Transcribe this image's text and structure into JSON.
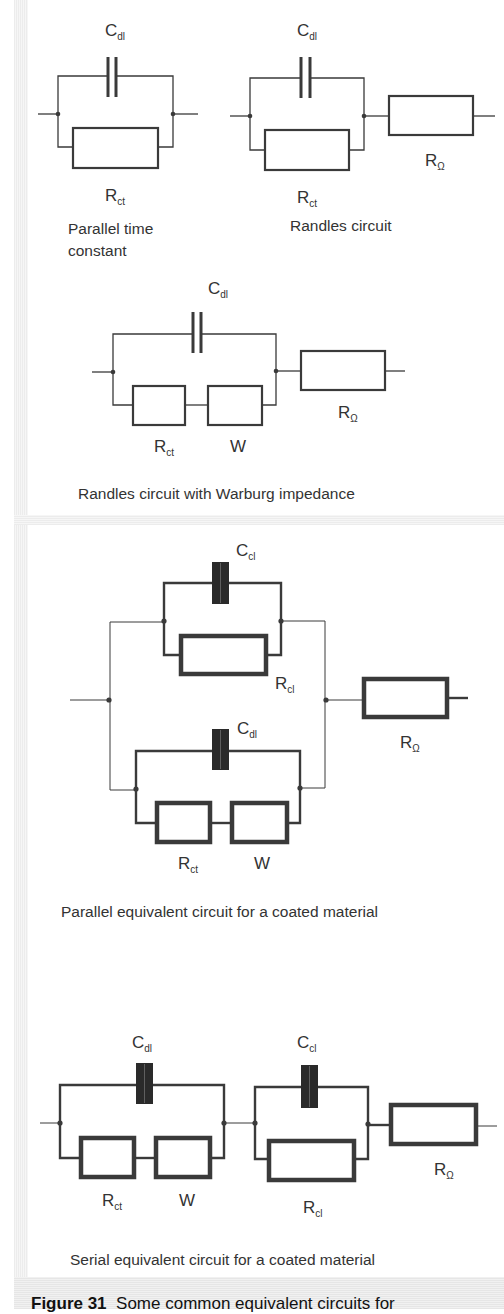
{
  "figure": {
    "number_label": "Figure 31",
    "caption_visible": "Some common equivalent circuits for"
  },
  "circuits": [
    {
      "id": "parallel-time-constant",
      "caption_line1": "Parallel time",
      "caption_line2": "constant",
      "components": [
        {
          "type": "capacitor",
          "label": "C",
          "sub": "dl"
        },
        {
          "type": "resistor",
          "label": "R",
          "sub": "ct"
        }
      ]
    },
    {
      "id": "randles",
      "caption": "Randles circuit",
      "components": [
        {
          "type": "capacitor",
          "label": "C",
          "sub": "dl"
        },
        {
          "type": "resistor",
          "label": "R",
          "sub": "ct"
        },
        {
          "type": "resistor",
          "label": "R",
          "sub": "Ω"
        }
      ]
    },
    {
      "id": "randles-warburg",
      "caption": "Randles circuit with Warburg impedance",
      "components": [
        {
          "type": "capacitor",
          "label": "C",
          "sub": "dl"
        },
        {
          "type": "resistor",
          "label": "R",
          "sub": "ct"
        },
        {
          "type": "warburg",
          "label": "W",
          "sub": ""
        },
        {
          "type": "resistor",
          "label": "R",
          "sub": "Ω"
        }
      ]
    },
    {
      "id": "parallel-coated",
      "caption": "Parallel equivalent circuit for a coated material",
      "components": [
        {
          "type": "capacitor",
          "label": "C",
          "sub": "cl"
        },
        {
          "type": "resistor",
          "label": "R",
          "sub": "cl"
        },
        {
          "type": "capacitor",
          "label": "C",
          "sub": "dl"
        },
        {
          "type": "resistor",
          "label": "R",
          "sub": "ct"
        },
        {
          "type": "warburg",
          "label": "W",
          "sub": ""
        },
        {
          "type": "resistor",
          "label": "R",
          "sub": "Ω"
        }
      ]
    },
    {
      "id": "serial-coated",
      "caption": "Serial equivalent circuit for a coated material",
      "components": [
        {
          "type": "capacitor",
          "label": "C",
          "sub": "dl"
        },
        {
          "type": "resistor",
          "label": "R",
          "sub": "ct"
        },
        {
          "type": "warburg",
          "label": "W",
          "sub": ""
        },
        {
          "type": "capacitor",
          "label": "C",
          "sub": "cl"
        },
        {
          "type": "resistor",
          "label": "R",
          "sub": "cl"
        },
        {
          "type": "resistor",
          "label": "R",
          "sub": "Ω"
        }
      ]
    }
  ]
}
